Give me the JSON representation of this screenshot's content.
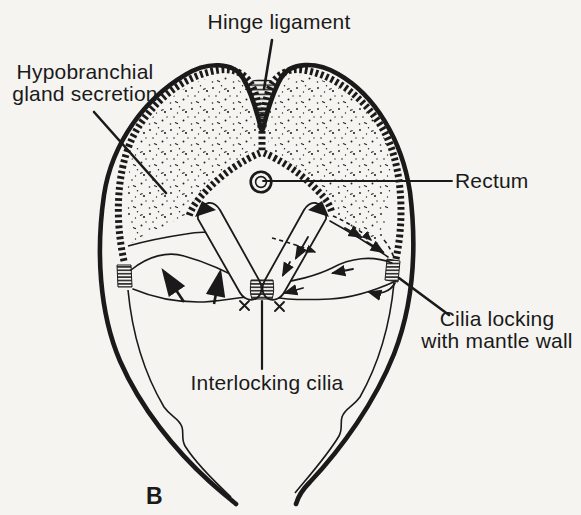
{
  "figure": {
    "panel_label": "B",
    "labels": {
      "hinge_ligament": "Hinge ligament",
      "hypobranchial": {
        "line1": "Hypobranchial",
        "line2": "gland secretion"
      },
      "rectum": "Rectum",
      "cilia_locking": {
        "line1": "Cilia locking",
        "line2": "with mantle wall"
      },
      "interlocking_cilia": "Interlocking cilia"
    },
    "colors": {
      "ink": "#1a1a1a",
      "paper": "#f5f4f1"
    }
  }
}
